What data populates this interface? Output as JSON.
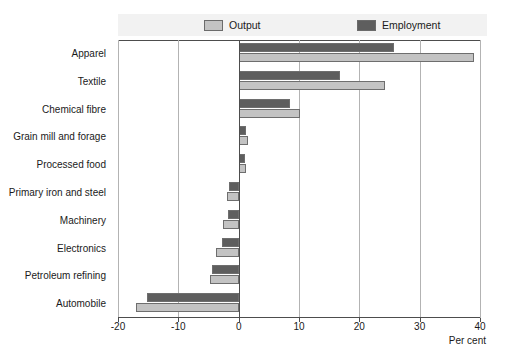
{
  "chart_data": {
    "type": "bar",
    "orientation": "horizontal",
    "title": "",
    "xlabel": "Per cent",
    "ylabel": "",
    "xlim": [
      -20,
      40
    ],
    "xticks": [
      -20,
      -10,
      0,
      10,
      20,
      30,
      40
    ],
    "xtick_labels": [
      "-20",
      "-10",
      "0",
      "10",
      "20",
      "30",
      "40"
    ],
    "grid": true,
    "grid_axis": "x",
    "legend_position": "top",
    "categories": [
      "Apparel",
      "Textile",
      "Chemical fibre",
      "Grain mill and forage",
      "Processed food",
      "Primary iron and steel",
      "Machinery",
      "Electronics",
      "Petroleum refining",
      "Automobile"
    ],
    "series": [
      {
        "name": "Output",
        "color": "#c3c3c3",
        "values": [
          39.0,
          24.2,
          10.2,
          1.5,
          1.3,
          -1.9,
          -2.6,
          -3.8,
          -4.8,
          -17.0
        ]
      },
      {
        "name": "Employment",
        "color": "#5e5e5e",
        "values": [
          25.8,
          16.8,
          8.5,
          1.3,
          1.1,
          -1.6,
          -1.8,
          -2.8,
          -4.5,
          -15.2
        ]
      }
    ]
  },
  "legend": {
    "items": [
      {
        "label": "Output",
        "color": "#c3c3c3"
      },
      {
        "label": "Employment",
        "color": "#5e5e5e"
      }
    ]
  },
  "axis": {
    "x_title": "Per cent"
  }
}
